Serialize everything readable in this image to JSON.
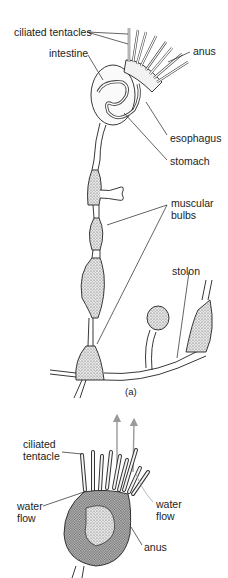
{
  "figure": {
    "panel_a": {
      "caption": "(a)",
      "labels": {
        "ciliated_tentacles": "ciliated tentacles",
        "intestine": "intestine",
        "anus": "anus",
        "esophagus": "esophagus",
        "stomach": "stomach",
        "muscular_bulbs_line1": "muscular",
        "muscular_bulbs_line2": "bulbs",
        "stolon": "stolon"
      }
    },
    "panel_b": {
      "labels": {
        "ciliated_tentacle_line1": "ciliated",
        "ciliated_tentacle_line2": "tentacle",
        "water_flow_left_line1": "water",
        "water_flow_left_line2": "flow",
        "water_flow_right_line1": "water",
        "water_flow_right_line2": "flow",
        "anus": "anus"
      },
      "colors": {
        "flow_arrow": "#9a9a9a"
      }
    }
  }
}
